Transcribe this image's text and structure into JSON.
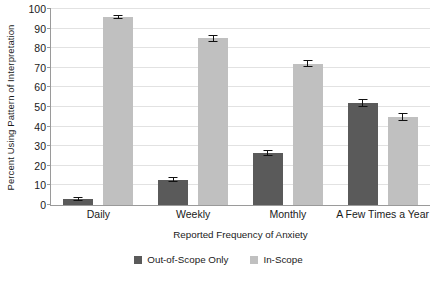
{
  "chart_data": {
    "type": "bar",
    "title": "",
    "subtitle": "",
    "xlabel": "Reported Frequency of Anxiety",
    "ylabel": "Percent Using Pattern of Interpretation",
    "categories": [
      "Daily",
      "Weekly",
      "Monthly",
      "A Few Times a Year"
    ],
    "series": [
      {
        "name": "Out-of-Scope Only",
        "color": "#5a5a5a",
        "values": [
          3,
          13,
          26.5,
          52
        ],
        "errors": [
          1.2,
          1.5,
          1.5,
          2.0
        ]
      },
      {
        "name": "In-Scope",
        "color": "#c0c0c0",
        "values": [
          96,
          85,
          72,
          45
        ],
        "errors": [
          1.0,
          1.8,
          1.8,
          2.0
        ]
      }
    ],
    "ylim": [
      0,
      100
    ],
    "yticks": [
      0,
      10,
      20,
      30,
      40,
      50,
      60,
      70,
      80,
      90,
      100
    ],
    "ytick_labels": [
      "0",
      "10",
      "20",
      "30",
      "40",
      "50",
      "60",
      "70",
      "80",
      "90",
      "100"
    ],
    "grid": true,
    "grid_axis": "y",
    "legend_position": "bottom",
    "error_bars": true
  },
  "colors": {
    "out_of_scope": "#5a5a5a",
    "in_scope": "#c0c0c0",
    "gridline": "#e2e2e2",
    "axis": "#9a9a9a",
    "text": "#1a1a1a",
    "background": "#ffffff"
  }
}
